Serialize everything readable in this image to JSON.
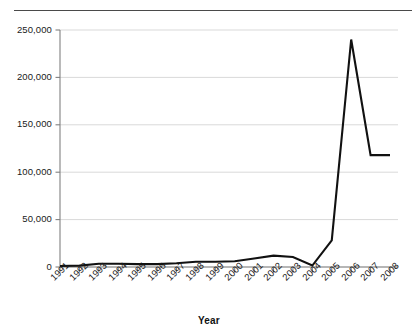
{
  "chart_data": {
    "type": "line",
    "title": "",
    "xlabel": "Year",
    "ylabel": "",
    "grid": true,
    "legend": false,
    "xlim": [
      1991,
      2008
    ],
    "ylim": [
      0,
      250000
    ],
    "ytick_labels": [
      "0",
      "50,000",
      "100,000",
      "150,000",
      "200,000",
      "250,000"
    ],
    "ytick_values": [
      0,
      50000,
      100000,
      150000,
      200000,
      250000
    ],
    "categories": [
      "1991",
      "1992",
      "1993",
      "1994",
      "1995",
      "1996",
      "1997",
      "1998",
      "1999",
      "2000",
      "2001",
      "2002",
      "2003",
      "2004",
      "2005",
      "2006",
      "2007",
      "2008"
    ],
    "values": [
      1000,
      1500,
      3500,
      3500,
      3000,
      3000,
      4000,
      5500,
      5500,
      6000,
      9000,
      12000,
      10500,
      1500,
      28000,
      240000,
      118000,
      118000
    ],
    "series": [
      {
        "name": "series-1",
        "values": [
          1000,
          1500,
          3500,
          3500,
          3000,
          3000,
          4000,
          5500,
          5500,
          6000,
          9000,
          12000,
          10500,
          1500,
          28000,
          240000,
          118000,
          118000
        ]
      }
    ],
    "line_color": "#111111",
    "grid_color": "#d9d9d9",
    "axis_color": "#808080"
  },
  "axis": {
    "x_title": "Year"
  }
}
